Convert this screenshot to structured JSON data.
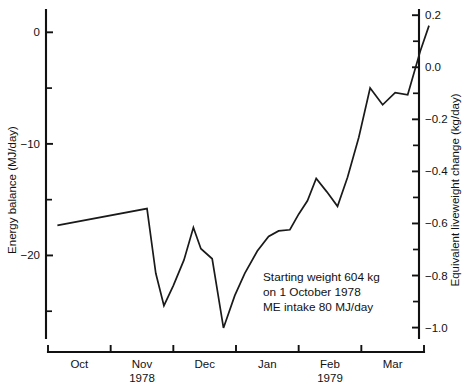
{
  "chart_data": {
    "type": "line",
    "title": "",
    "xlabel": "",
    "ylabel": "Energy balance (MJ/day)",
    "y2label": "Equivalent liveweight change (kg/day)",
    "grid": false,
    "legend": "none",
    "ylim": [
      -27.4,
      2.0
    ],
    "y2lim": [
      -1.04,
      0.22
    ],
    "yticks": [
      "0",
      "−10",
      "−20"
    ],
    "ytick_values": [
      0,
      -10,
      -20
    ],
    "yminor_values": [
      -5,
      -15,
      -25
    ],
    "y2ticks": [
      "0.2",
      "0.0",
      "−0.2",
      "−0.4",
      "−0.6",
      "−0.8",
      "−1.0"
    ],
    "y2tick_values": [
      0.2,
      0.0,
      -0.2,
      -0.4,
      -0.6,
      -0.8,
      -1.0
    ],
    "y2minor_values": [
      0.1,
      -0.1,
      -0.3,
      -0.5,
      -0.7,
      -0.9
    ],
    "xtick_count": 7,
    "xlim": [
      0,
      6
    ],
    "categories": [
      "Oct",
      "Nov 1978",
      "Dec",
      "Jan",
      "Feb 1979",
      "Mar"
    ],
    "month_labels": [
      {
        "line1": "Oct",
        "line2": "",
        "center": 0.5
      },
      {
        "line1": "Nov",
        "line2": "1978",
        "center": 1.5
      },
      {
        "line1": "Dec",
        "line2": "",
        "center": 2.5
      },
      {
        "line1": "Jan",
        "line2": "",
        "center": 3.5
      },
      {
        "line1": "Feb",
        "line2": "1979",
        "center": 4.5
      },
      {
        "line1": "Mar",
        "line2": "",
        "center": 5.5
      }
    ],
    "series": [
      {
        "name": "Energy balance",
        "x": [
          0.15,
          1.58,
          1.72,
          1.85,
          2.0,
          2.17,
          2.32,
          2.44,
          2.62,
          2.8,
          2.98,
          3.14,
          3.34,
          3.52,
          3.68,
          3.86,
          4.0,
          4.14,
          4.28,
          4.45,
          4.62,
          4.78,
          4.96,
          5.14,
          5.34,
          5.54,
          5.74,
          5.94,
          6.08
        ],
        "values": [
          -17.3,
          -15.8,
          -21.6,
          -24.5,
          -22.7,
          -20.4,
          -17.5,
          -19.4,
          -20.3,
          -26.5,
          -23.6,
          -21.6,
          -19.6,
          -18.3,
          -17.8,
          -17.7,
          -16.3,
          -15.1,
          -13.1,
          -14.3,
          -15.6,
          -13.0,
          -9.4,
          -5.0,
          -6.5,
          -5.4,
          -5.6,
          -1.7,
          0.6
        ]
      }
    ],
    "annotation": {
      "line1": "Starting weight 604 kg",
      "line2": "on 1 October 1978",
      "line3": "ME intake 80 MJ/day"
    },
    "colors": {
      "line": "#1a1a1a",
      "axis": "#111111",
      "background": "#ffffff"
    }
  }
}
